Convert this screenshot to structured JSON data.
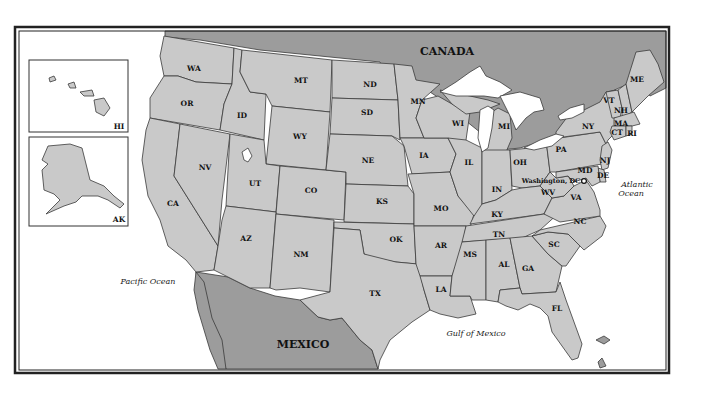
{
  "map": {
    "title": "United States",
    "colors": {
      "us_land": "#c9c9c9",
      "foreign_land": "#9c9c9c",
      "water": "#ffffff",
      "border": "#3a3a3a"
    },
    "countries": {
      "canada": "CANADA",
      "mexico": "MEXICO"
    },
    "water_bodies": {
      "pacific": "Pacific Ocean",
      "atlantic_line1": "Atlantic",
      "atlantic_line2": "Ocean",
      "gulf": "Gulf of Mexico"
    },
    "capital": "Washington, DC",
    "insets": {
      "hawaii": "HI",
      "alaska": "AK"
    },
    "states": {
      "WA": "WA",
      "OR": "OR",
      "CA": "CA",
      "ID": "ID",
      "NV": "NV",
      "MT": "MT",
      "WY": "WY",
      "UT": "UT",
      "AZ": "AZ",
      "CO": "CO",
      "NM": "NM",
      "ND": "ND",
      "SD": "SD",
      "NE": "NE",
      "KS": "KS",
      "OK": "OK",
      "TX": "TX",
      "MN": "MN",
      "IA": "IA",
      "MO": "MO",
      "AR": "AR",
      "LA": "LA",
      "WI": "WI",
      "IL": "IL",
      "MI": "MI",
      "IN": "IN",
      "OH": "OH",
      "KY": "KY",
      "TN": "TN",
      "MS": "MS",
      "AL": "AL",
      "GA": "GA",
      "FL": "FL",
      "SC": "SC",
      "NC": "NC",
      "VA": "VA",
      "WV": "WV",
      "PA": "PA",
      "NY": "NY",
      "VT": "VT",
      "NH": "NH",
      "ME": "ME",
      "MA": "MA",
      "CT": "CT",
      "RI": "RI",
      "NJ": "NJ",
      "DE": "DE",
      "MD": "MD"
    }
  }
}
